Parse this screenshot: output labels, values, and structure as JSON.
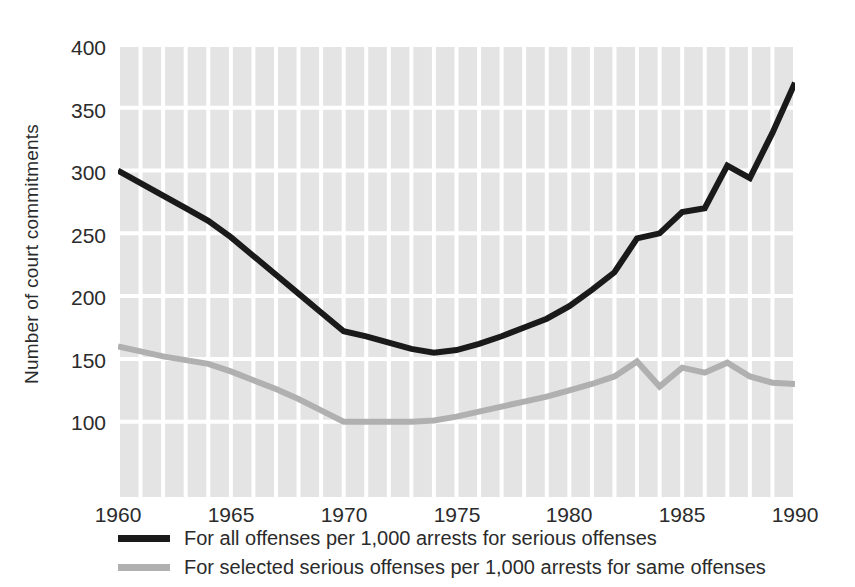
{
  "chart_data": {
    "type": "line",
    "title": "",
    "xlabel": "",
    "ylabel": "Number of court commitments",
    "xlim": [
      1960,
      1990
    ],
    "ylim": [
      40,
      400
    ],
    "yticks": [
      400,
      350,
      300,
      250,
      200,
      150,
      100
    ],
    "xticks": [
      1960,
      1965,
      1970,
      1975,
      1980,
      1985,
      1990
    ],
    "grid": true,
    "legend_position": "below",
    "x": [
      1960,
      1961,
      1962,
      1963,
      1964,
      1965,
      1966,
      1967,
      1968,
      1969,
      1970,
      1971,
      1972,
      1973,
      1974,
      1975,
      1976,
      1977,
      1978,
      1979,
      1980,
      1981,
      1982,
      1983,
      1984,
      1985,
      1986,
      1987,
      1988,
      1989,
      1990
    ],
    "series": [
      {
        "name": "For all offenses per 1,000 arrests for serious offenses",
        "color": "#1a1a1a",
        "values": [
          300,
          290,
          280,
          270,
          260,
          247,
          232,
          217,
          202,
          187,
          172,
          168,
          163,
          158,
          155,
          157,
          162,
          168,
          175,
          182,
          192,
          205,
          219,
          246,
          250,
          267,
          270,
          304,
          294,
          330,
          370
        ]
      },
      {
        "name": "For selected serious offenses per 1,000 arrests for same offenses",
        "color": "#b0b0b0",
        "values": [
          160,
          156,
          152,
          149,
          146,
          140,
          133,
          126,
          118,
          109,
          100,
          100,
          100,
          100,
          101,
          104,
          108,
          112,
          116,
          120,
          125,
          130,
          136,
          148,
          128,
          143,
          139,
          147,
          136,
          131,
          130
        ]
      }
    ]
  },
  "axis": {
    "y_title": "Number of court commitments",
    "y_tick_labels": [
      "400",
      "350",
      "300",
      "250",
      "200",
      "150",
      "100"
    ],
    "x_tick_labels": [
      "1960",
      "1965",
      "1970",
      "1975",
      "1980",
      "1985",
      "1990"
    ]
  },
  "legend": {
    "items": [
      {
        "label": "For all offenses per 1,000 arrests for serious offenses",
        "swatch": "black"
      },
      {
        "label": "For selected serious offenses per 1,000 arrests for same offenses",
        "swatch": "gray"
      }
    ]
  },
  "colors": {
    "plot_background": "#e4e4e4",
    "gridline": "#ffffff",
    "series_primary": "#1a1a1a",
    "series_secondary": "#b0b0b0",
    "text": "#2b2b2b"
  }
}
